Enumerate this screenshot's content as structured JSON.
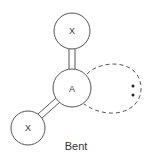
{
  "diagram": {
    "caption": "Bent",
    "atoms": [
      {
        "label": "X",
        "role": "terminal-top",
        "cx": 72,
        "cy": 31,
        "r": 18
      },
      {
        "label": "A",
        "role": "central",
        "cx": 72,
        "cy": 88,
        "r": 19
      },
      {
        "label": "X",
        "role": "terminal-bottom-left",
        "cx": 28,
        "cy": 128,
        "r": 17
      }
    ],
    "bonds": [
      {
        "from": 0,
        "to": 1,
        "type": "double"
      },
      {
        "from": 1,
        "to": 2,
        "type": "double"
      }
    ],
    "lone_pair": {
      "electrons": 2,
      "style": "dashed-lobe"
    },
    "colors": {
      "stroke": "#555555",
      "text": "#333333",
      "background": "#ffffff"
    }
  }
}
